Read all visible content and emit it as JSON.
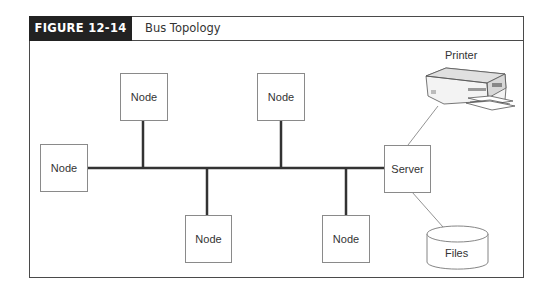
{
  "figure": {
    "number_label": "FIGURE 12-14",
    "title": "Bus Topology"
  },
  "diagram": {
    "type": "bus-topology",
    "nodes": [
      {
        "id": "node-left",
        "label": "Node"
      },
      {
        "id": "node-top-1",
        "label": "Node"
      },
      {
        "id": "node-top-2",
        "label": "Node"
      },
      {
        "id": "node-bottom-1",
        "label": "Node"
      },
      {
        "id": "node-bottom-2",
        "label": "Node"
      },
      {
        "id": "server",
        "label": "Server"
      }
    ],
    "peripherals": {
      "printer_label": "Printer",
      "files_label": "Files"
    },
    "colors": {
      "bus_line": "#333333",
      "box_border": "#8a8a8a",
      "header_bg": "#222222"
    }
  }
}
